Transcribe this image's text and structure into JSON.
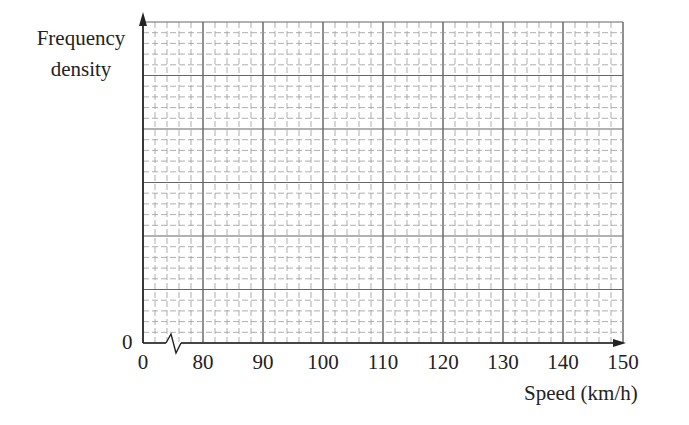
{
  "chart_data": {
    "type": "histogram",
    "title": "",
    "xlabel": "Speed (km/h)",
    "ylabel": "Frequency density",
    "x_ticks": [
      "0",
      "80",
      "90",
      "100",
      "110",
      "120",
      "130",
      "140",
      "150"
    ],
    "y_ticks": [
      "0"
    ],
    "xlim": [
      70,
      150
    ],
    "x_axis_break": true,
    "grid": true,
    "grid_minor_x_step": 2,
    "grid_major_x_step": 10,
    "grid_rows": 30,
    "grid_major_row_every": 5,
    "series": [],
    "note": "Blank grid on which a histogram is to be drawn; no bars plotted."
  },
  "labels": {
    "ylabel_line1": "Frequency",
    "ylabel_line2": "density",
    "y_origin": "0",
    "x_origin": "0",
    "xlabel": "Speed (km/h)"
  },
  "x_tick_labels": [
    {
      "text": "0",
      "x": 143
    },
    {
      "text": "80",
      "x": 203
    },
    {
      "text": "90",
      "x": 263
    },
    {
      "text": "100",
      "x": 323
    },
    {
      "text": "110",
      "x": 383
    },
    {
      "text": "120",
      "x": 443
    },
    {
      "text": "130",
      "x": 503
    },
    {
      "text": "140",
      "x": 563
    },
    {
      "text": "150",
      "x": 623
    }
  ]
}
